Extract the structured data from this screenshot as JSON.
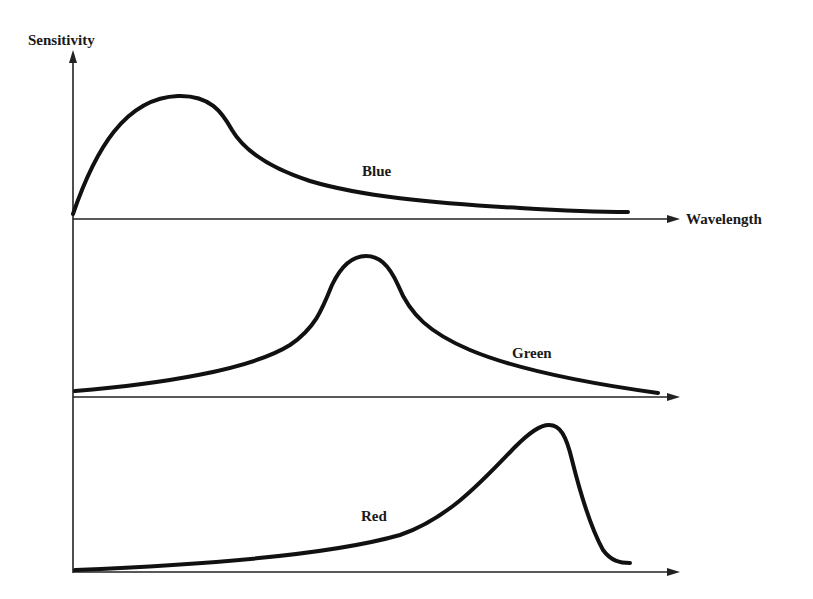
{
  "figure": {
    "y_axis_label": "Sensitivity",
    "x_axis_label": "Wavelength",
    "colors": {
      "ink": "#111111",
      "background": "#ffffff"
    },
    "curves": [
      {
        "name": "blue",
        "label": "Blue",
        "description": "Peaks at short wavelengths, long tail toward longer wavelengths"
      },
      {
        "name": "green",
        "label": "Green",
        "description": "Symmetric peak at mid wavelengths"
      },
      {
        "name": "red",
        "label": "Red",
        "description": "Gradual rise, sharp peak at long wavelengths, steep drop-off"
      }
    ]
  }
}
